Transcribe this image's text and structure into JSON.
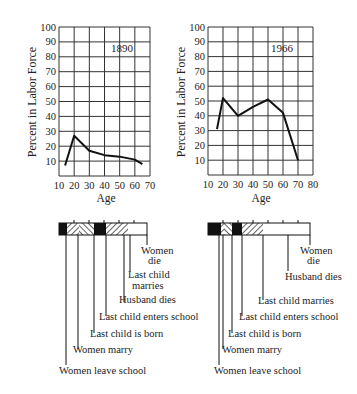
{
  "chart_data": [
    {
      "type": "line",
      "title": "1890",
      "xlabel": "Age",
      "ylabel": "Percent in Labor Force",
      "x_ticks": [
        10,
        20,
        30,
        40,
        50,
        60,
        70
      ],
      "y_ticks": [
        10,
        20,
        30,
        40,
        50,
        60,
        70,
        80,
        90,
        100
      ],
      "xlim": [
        10,
        70
      ],
      "ylim": [
        0,
        100
      ],
      "grid": true,
      "x": [
        14,
        20,
        30,
        40,
        50,
        60,
        65
      ],
      "values": [
        7,
        27,
        17,
        14,
        13,
        11,
        8
      ]
    },
    {
      "type": "line",
      "title": "1966",
      "xlabel": "Age",
      "ylabel": "Percent in Labor Force",
      "x_ticks": [
        10,
        20,
        30,
        40,
        50,
        60,
        70,
        80
      ],
      "y_ticks": [
        10,
        20,
        30,
        40,
        50,
        60,
        70,
        80,
        90,
        100
      ],
      "xlim": [
        10,
        80
      ],
      "ylim": [
        0,
        100
      ],
      "grid": true,
      "x": [
        16,
        20,
        30,
        40,
        50,
        60,
        70
      ],
      "values": [
        31,
        52,
        40,
        46,
        51,
        42,
        10
      ]
    },
    {
      "type": "timeline",
      "title": "1890 life cycle",
      "events": [
        "Women leave school",
        "Women marry",
        "Last child is born",
        "Last child enters school",
        "Husband dies",
        "Last child marries",
        "Women die"
      ]
    },
    {
      "type": "timeline",
      "title": "1966 life cycle",
      "events": [
        "Women leave school",
        "Women marry",
        "Last child is born",
        "Last child enters school",
        "Last child marries",
        "Husband dies",
        "Women die"
      ]
    }
  ],
  "labels": {
    "ylabel": "Percent in Labor Force",
    "xlabel": "Age",
    "year_left": "1890",
    "year_right": "1966",
    "women_die_1": "Women",
    "women_die_2": "die",
    "lcm_1": "Last child",
    "lcm_2": "marries",
    "husband_dies": "Husband dies",
    "last_child_enters": "Last child enters school",
    "last_child_born": "Last child is born",
    "women_marry": "Women marry",
    "women_leave": "Women leave school",
    "last_child_marries": "Last child marries"
  }
}
